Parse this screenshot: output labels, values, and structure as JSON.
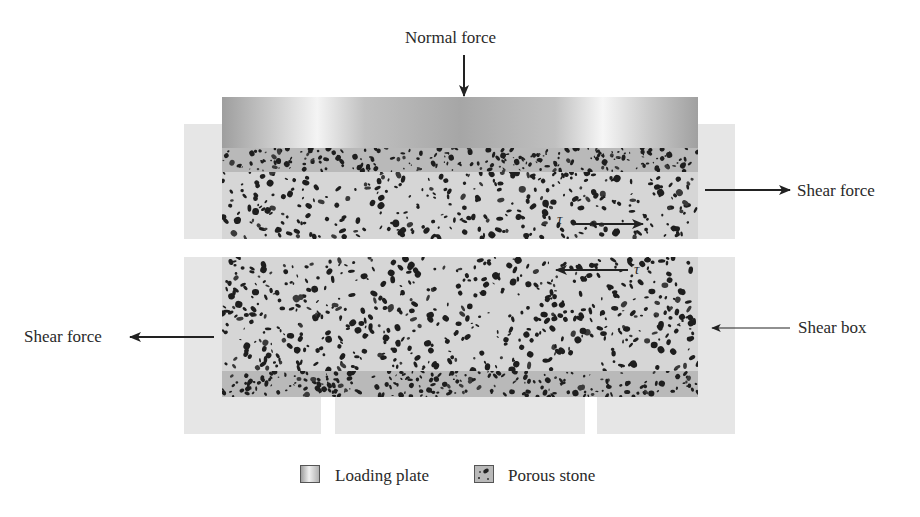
{
  "diagram": {
    "labels": {
      "normal_force": "Normal force",
      "shear_force_right": "Shear force",
      "shear_force_left": "Shear force",
      "shear_box": "Shear box",
      "tau_upper": "τ",
      "tau_lower": "τ"
    },
    "components": [
      {
        "name": "loading-plate",
        "color": "#a6a6a6"
      },
      {
        "name": "upper-porous-stone",
        "color": "#b9b9b9"
      },
      {
        "name": "upper-soil-sample",
        "color": "#d6d6d6"
      },
      {
        "name": "lower-soil-sample",
        "color": "#d6d6d6"
      },
      {
        "name": "lower-porous-stone",
        "color": "#b9b9b9"
      },
      {
        "name": "shear-box",
        "color": "#e6e6e6"
      }
    ],
    "arrows": [
      {
        "name": "normal-force-arrow",
        "direction": "down"
      },
      {
        "name": "shear-force-right-arrow",
        "direction": "right"
      },
      {
        "name": "shear-force-left-arrow",
        "direction": "left"
      },
      {
        "name": "shear-box-pointer-arrow",
        "direction": "left"
      },
      {
        "name": "tau-upper-arrow",
        "direction": "right"
      },
      {
        "name": "tau-lower-arrow",
        "direction": "left"
      }
    ]
  },
  "legend": {
    "items": [
      {
        "label": "Loading plate",
        "icon": "loading-plate-swatch"
      },
      {
        "label": "Porous stone",
        "icon": "porous-stone-swatch"
      }
    ]
  }
}
